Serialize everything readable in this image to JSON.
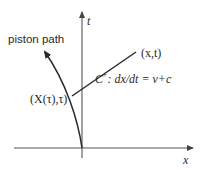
{
  "diagram": {
    "type": "characteristic-diagram",
    "axes": {
      "x_label": "x",
      "t_label": "t"
    },
    "curves": {
      "piston_path_label": "piston path",
      "characteristic_name": "C",
      "characteristic_sup": "+",
      "characteristic_eq": ": dx/dt = v+c"
    },
    "points": {
      "start_label": "(X(τ),τ)",
      "end_label": "(x,t)"
    },
    "colors": {
      "stroke": "#2a2a2a",
      "axis": "#555555",
      "background": "#ffffff"
    }
  }
}
